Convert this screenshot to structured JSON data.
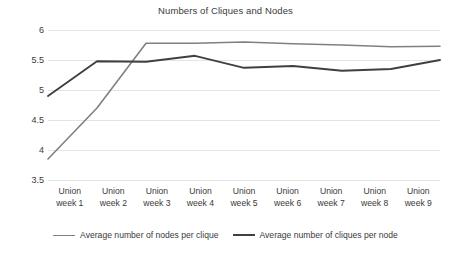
{
  "chart_data": {
    "type": "line",
    "title": "Numbers of Cliques and Nodes",
    "xlabel": "",
    "ylabel": "",
    "ylim": [
      3.5,
      6
    ],
    "yticks": [
      "3.5",
      "4",
      "4.5",
      "5",
      "5.5",
      "6"
    ],
    "grid": true,
    "legend_position": "bottom",
    "categories": [
      "Union week 1",
      "Union week 2",
      "Union week 3",
      "Union week 4",
      "Union week 5",
      "Union week 6",
      "Union week 7",
      "Union week 8",
      "Union week 9"
    ],
    "series": [
      {
        "name": "Average number of nodes per clique",
        "color": "#808080",
        "values": [
          3.85,
          4.7,
          5.78,
          5.78,
          5.8,
          5.77,
          5.75,
          5.72,
          5.73
        ]
      },
      {
        "name": "Average number of cliques per node",
        "color": "#404040",
        "values": [
          4.9,
          5.48,
          5.47,
          5.57,
          5.37,
          5.4,
          5.32,
          5.35,
          5.5
        ]
      }
    ]
  }
}
